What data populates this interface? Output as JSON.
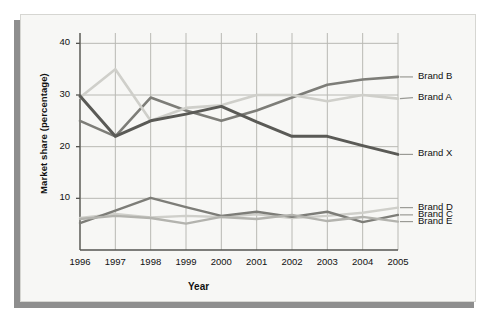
{
  "figure": {
    "background_color": "#f7f7f5",
    "shadow_color": "#8e8e8e"
  },
  "chart_data": {
    "type": "line",
    "title": "",
    "xlabel": "Year",
    "ylabel": "Market share (percentage)",
    "categories": [
      "1996",
      "1997",
      "1998",
      "1999",
      "2000",
      "2001",
      "2002",
      "2003",
      "2004",
      "2005"
    ],
    "x": [
      1996,
      1997,
      1998,
      1999,
      2000,
      2001,
      2002,
      2003,
      2004,
      2005
    ],
    "xlim": [
      1996,
      2005
    ],
    "ylim": [
      0,
      42
    ],
    "yticks": [
      10,
      20,
      30,
      40
    ],
    "ytick_labels": [
      "10",
      "20",
      "30",
      "40"
    ],
    "grid": true,
    "legend_position": "right-of-axes",
    "series": [
      {
        "name": "Brand B",
        "color": "#7d7d78",
        "width": 2.6,
        "label_y_value": 33.5,
        "values": [
          25.0,
          22.0,
          29.5,
          27.0,
          25.0,
          27.0,
          29.5,
          32.0,
          33.0,
          33.5
        ]
      },
      {
        "name": "Brand A",
        "color": "#cfcfca",
        "width": 2.6,
        "label_y_value": 29.5,
        "values": [
          29.5,
          35.0,
          25.0,
          27.5,
          28.0,
          30.0,
          30.0,
          28.8,
          30.0,
          29.3
        ]
      },
      {
        "name": "Brand X",
        "color": "#5a5a56",
        "width": 3.0,
        "label_y_value": 18.5,
        "values": [
          29.8,
          22.0,
          25.0,
          26.3,
          27.8,
          24.8,
          22.0,
          22.0,
          20.2,
          18.5
        ]
      },
      {
        "name": "Brand D",
        "color": "#cfcfca",
        "width": 2.4,
        "label_y_value": 8.2,
        "values": [
          6.2,
          7.0,
          6.3,
          6.6,
          6.4,
          6.9,
          6.2,
          6.6,
          7.2,
          8.2
        ]
      },
      {
        "name": "Brand C",
        "color": "#7d7d78",
        "width": 2.4,
        "label_y_value": 6.8,
        "values": [
          5.2,
          7.6,
          10.1,
          8.3,
          6.6,
          7.4,
          6.4,
          7.4,
          5.4,
          6.8
        ]
      },
      {
        "name": "Brand E",
        "color": "#b3b3ae",
        "width": 2.4,
        "label_y_value": 5.5,
        "values": [
          6.0,
          6.6,
          6.2,
          5.1,
          6.4,
          6.0,
          6.8,
          5.6,
          6.4,
          5.5
        ]
      }
    ]
  },
  "legend": {
    "items": [
      {
        "label": "Brand B"
      },
      {
        "label": "Brand A"
      },
      {
        "label": "Brand X"
      },
      {
        "label": "Brand D"
      },
      {
        "label": "Brand C"
      },
      {
        "label": "Brand E"
      }
    ]
  }
}
